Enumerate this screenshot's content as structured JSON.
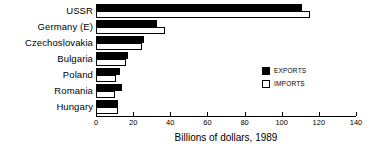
{
  "chart_data": {
    "type": "bar",
    "orientation": "horizontal",
    "title": "",
    "xlabel": "Billions of dollars, 1989",
    "ylabel": "",
    "xlim": [
      0,
      140
    ],
    "xticks": [
      0,
      20,
      40,
      60,
      80,
      100,
      120,
      140
    ],
    "grid": false,
    "legend_position": "center-right",
    "categories": [
      "USSR",
      "Germany (E)",
      "Czechoslovakia",
      "Bulgaria",
      "Poland",
      "Romania",
      "Hungary"
    ],
    "series": [
      {
        "name": "EXPORTS",
        "color": "#000000",
        "values": [
          111,
          33,
          26,
          17,
          13,
          14,
          12
        ]
      },
      {
        "name": "IMPORTS",
        "color": "#ffffff",
        "values": [
          115,
          37,
          25,
          16,
          11,
          10,
          12
        ]
      }
    ]
  },
  "legend": {
    "items": [
      {
        "label": "EXPORTS",
        "swatch": "exports"
      },
      {
        "label": "IMPORTS",
        "swatch": "imports"
      }
    ]
  }
}
